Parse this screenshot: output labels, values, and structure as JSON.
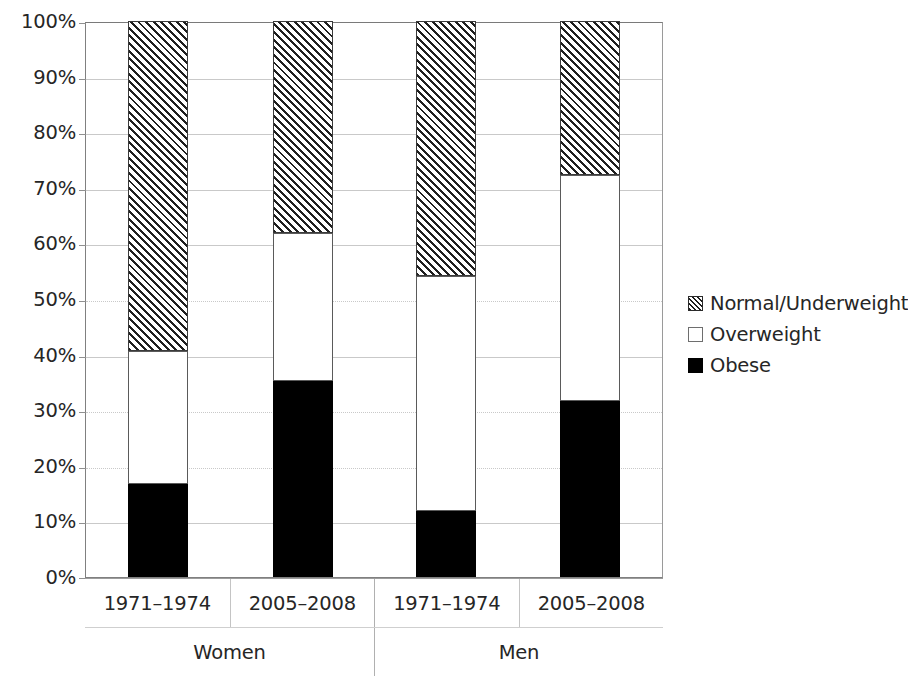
{
  "chart_data": {
    "type": "bar",
    "subtype": "stacked-100-percent",
    "title": "",
    "xlabel": "",
    "ylabel": "",
    "ylim": [
      0,
      100
    ],
    "y_tick_labels": [
      "100%",
      "90%",
      "80%",
      "70%",
      "60%",
      "50%",
      "40%",
      "30%",
      "20%",
      "10%",
      "0%"
    ],
    "y_tick_values": [
      100,
      90,
      80,
      70,
      60,
      50,
      40,
      30,
      20,
      10,
      0
    ],
    "grid": true,
    "legend_position": "right",
    "categories": [
      "1971–1974",
      "2005–2008",
      "1971–1974",
      "2005–2008"
    ],
    "group_labels": [
      "Women",
      "Men"
    ],
    "groups": [
      {
        "label": "Women",
        "categories": [
          "1971–1974",
          "2005–2008"
        ]
      },
      {
        "label": "Men",
        "categories": [
          "1971–1974",
          "2005–2008"
        ]
      }
    ],
    "series": [
      {
        "name": "Obese",
        "fill": "solid-black",
        "values": [
          16.8,
          35.3,
          11.9,
          31.7
        ]
      },
      {
        "name": "Overweight",
        "fill": "white",
        "values": [
          23.9,
          26.5,
          42.3,
          40.6
        ]
      },
      {
        "name": "Normal/Underweight",
        "fill": "diagonal-hatch",
        "values": [
          59.3,
          38.2,
          45.8,
          27.7
        ]
      }
    ],
    "stack_order_bottom_to_top": [
      "Obese",
      "Overweight",
      "Normal/Underweight"
    ],
    "cumulative_tops": [
      {
        "category": "Women 1971–1974",
        "obese_top": 16.8,
        "overweight_top": 40.7,
        "normal_top": 100
      },
      {
        "category": "Women 2005–2008",
        "obese_top": 35.3,
        "overweight_top": 61.8,
        "normal_top": 100
      },
      {
        "category": "Men 1971–1974",
        "obese_top": 11.9,
        "overweight_top": 54.2,
        "normal_top": 100
      },
      {
        "category": "Men 2005–2008",
        "obese_top": 31.7,
        "overweight_top": 72.3,
        "normal_top": 100
      }
    ]
  },
  "legend": {
    "items": [
      {
        "label": "Normal/Underweight",
        "swatch": "diagonal-hatch-swatch"
      },
      {
        "label": "Overweight",
        "swatch": "white-swatch"
      },
      {
        "label": "Obese",
        "swatch": "black-swatch"
      }
    ]
  },
  "colors": {
    "obese": "#000000",
    "overweight": "#ffffff",
    "normal_underweight_hatch": "#1f1f1f",
    "axis": "#808080",
    "gridline": "#c9c9c9",
    "text": "#262626",
    "background": "#ffffff"
  }
}
